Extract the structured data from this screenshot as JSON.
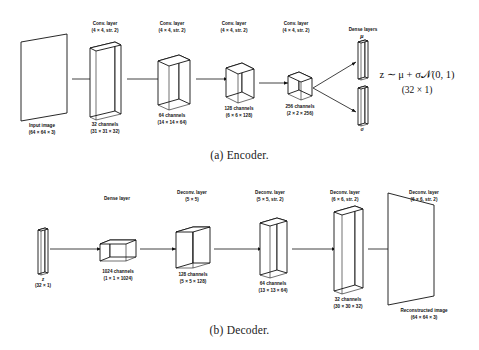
{
  "figure": {
    "captions": {
      "encoder": "(a) Encoder.",
      "decoder": "(b) Decoder."
    }
  },
  "encoder": {
    "op_labels": [
      {
        "line1": "Conv. layer",
        "line2": "(4 × 4, str. 2)"
      },
      {
        "line1": "Conv. layer",
        "line2": "(4 × 4, str. 2)"
      },
      {
        "line1": "Conv. layer",
        "line2": "(4 × 4, str. 2)"
      },
      {
        "line1": "Conv. layer",
        "line2": "(4 × 4, str. 2)"
      },
      {
        "line1": "Dense layers",
        "line2": ""
      }
    ],
    "tensor_labels": [
      {
        "line1": "Input image",
        "line2": "(64 × 64 × 3)"
      },
      {
        "line1": "32 channels",
        "line2": "(31 × 31 × 32)"
      },
      {
        "line1": "64 channels",
        "line2": "(14 × 14 × 64)"
      },
      {
        "line1": "128 channels",
        "line2": "(6 × 6 × 128)"
      },
      {
        "line1": "256 channels",
        "line2": "(2 × 2 × 256)"
      }
    ],
    "mu_symbol": "μ",
    "sigma_symbol": "σ",
    "equation": {
      "main": "z ∼ μ + σ𝒩(0, 1)",
      "dims": "(32 × 1)"
    }
  },
  "decoder": {
    "op_labels": [
      {
        "line1": "Dense layer",
        "line2": ""
      },
      {
        "line1": "Deconv. layer",
        "line2": "(5 × 5)"
      },
      {
        "line1": "Deconv. layer",
        "line2": "(5 × 5, str. 2)"
      },
      {
        "line1": "Deconv. layer",
        "line2": "(6 × 6, str. 2)"
      },
      {
        "line1": "Deconv. layer",
        "line2": "(6 × 6, str. 2)"
      }
    ],
    "tensor_labels": [
      {
        "line1": "",
        "line2": "(32 × 1)"
      },
      {
        "line1": "1024 channels",
        "line2": "(1 × 1 × 1024)"
      },
      {
        "line1": "128 channels",
        "line2": "(5 × 5 × 128)"
      },
      {
        "line1": "64 channels",
        "line2": "(13 × 13 × 64)"
      },
      {
        "line1": "32 channels",
        "line2": "(30 × 30 × 32)"
      },
      {
        "line1": "Reconstructed image",
        "line2": "(64 × 64 × 3)"
      }
    ],
    "z_symbol": "z"
  },
  "colors": {
    "stroke": "#111111",
    "face": "#ffffff",
    "background": "#ffffff"
  }
}
